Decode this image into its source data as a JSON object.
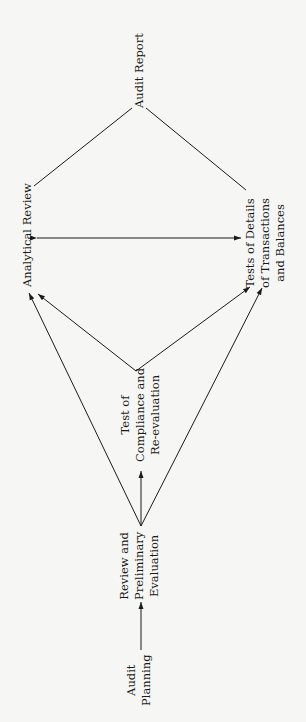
{
  "diagram": {
    "orientation": "rotated-90-ccw",
    "nodes": {
      "audit_planning": {
        "lines": [
          "Audit",
          "Planning"
        ]
      },
      "review_preliminary": {
        "lines": [
          "Review and",
          "Preliminary",
          "Evaluation"
        ]
      },
      "test_compliance": {
        "lines": [
          "Test of",
          "Compliance and",
          "Re-evaluation"
        ]
      },
      "analytical_review": {
        "lines": [
          "Analytical Review"
        ]
      },
      "tests_of_details": {
        "lines": [
          "Tests of Details",
          "of Transactions",
          "and Balances"
        ]
      },
      "audit_report": {
        "lines": [
          "Audit Report"
        ]
      }
    },
    "edges": [
      {
        "from": "Audit Planning",
        "to": "Review and Preliminary Evaluation",
        "type": "arrow"
      },
      {
        "from": "Review and Preliminary Evaluation",
        "to": "Test of Compliance and Re-evaluation",
        "type": "arrow"
      },
      {
        "from": "Review and Preliminary Evaluation",
        "to": "Analytical Review",
        "type": "arrow"
      },
      {
        "from": "Review and Preliminary Evaluation",
        "to": "Tests of Details of Transactions and Balances",
        "type": "arrow"
      },
      {
        "from": "Test of Compliance and Re-evaluation",
        "to": "Analytical Review",
        "type": "arrow"
      },
      {
        "from": "Test of Compliance and Re-evaluation",
        "to": "Tests of Details of Transactions and Balances",
        "type": "arrow"
      },
      {
        "from": "Analytical Review",
        "to": "Tests of Details of Transactions and Balances",
        "type": "double-arrow"
      },
      {
        "from": "Analytical Review",
        "to": "Audit Report",
        "type": "line"
      },
      {
        "from": "Tests of Details of Transactions and Balances",
        "to": "Audit Report",
        "type": "line"
      }
    ],
    "colors": {
      "background": "#f6f6f4",
      "ink": "#1a1a1a"
    }
  }
}
